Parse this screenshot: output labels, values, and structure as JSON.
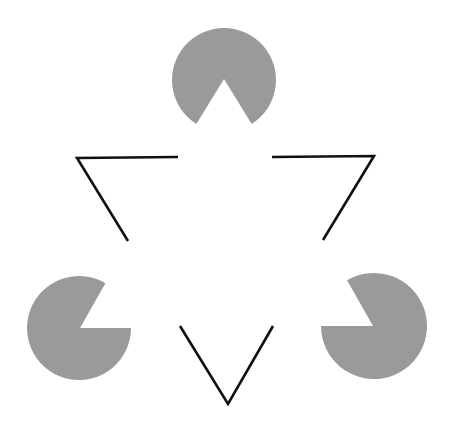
{
  "figure": {
    "width": 462,
    "height": 438,
    "background": "#ffffff",
    "pacman_color": "#9a9a9a",
    "line_color": "#111111",
    "line_width": 2.6
  },
  "pacmen": [
    {
      "name": "top",
      "cx": 224,
      "cy": 80,
      "r": 52,
      "apex": [
        224,
        79
      ],
      "edge1": [
        197,
        123
      ],
      "edge2": [
        251,
        123
      ]
    },
    {
      "name": "left",
      "cx": 79,
      "cy": 328,
      "r": 52,
      "apex": [
        80,
        328
      ],
      "edge1": [
        132,
        328
      ],
      "edge2": [
        105,
        284
      ]
    },
    {
      "name": "right",
      "cx": 374,
      "cy": 326,
      "r": 53,
      "apex": [
        373,
        326
      ],
      "edge1": [
        321,
        326
      ],
      "edge2": [
        348,
        282
      ]
    }
  ],
  "outline_corners": [
    {
      "name": "left",
      "points": [
        [
          178,
          157
        ],
        [
          77,
          158
        ],
        [
          128,
          241
        ]
      ]
    },
    {
      "name": "right",
      "points": [
        [
          272,
          157
        ],
        [
          374,
          156
        ],
        [
          323,
          240
        ]
      ]
    },
    {
      "name": "bottom",
      "points": [
        [
          180,
          326
        ],
        [
          228,
          404
        ],
        [
          273,
          326
        ]
      ]
    }
  ]
}
